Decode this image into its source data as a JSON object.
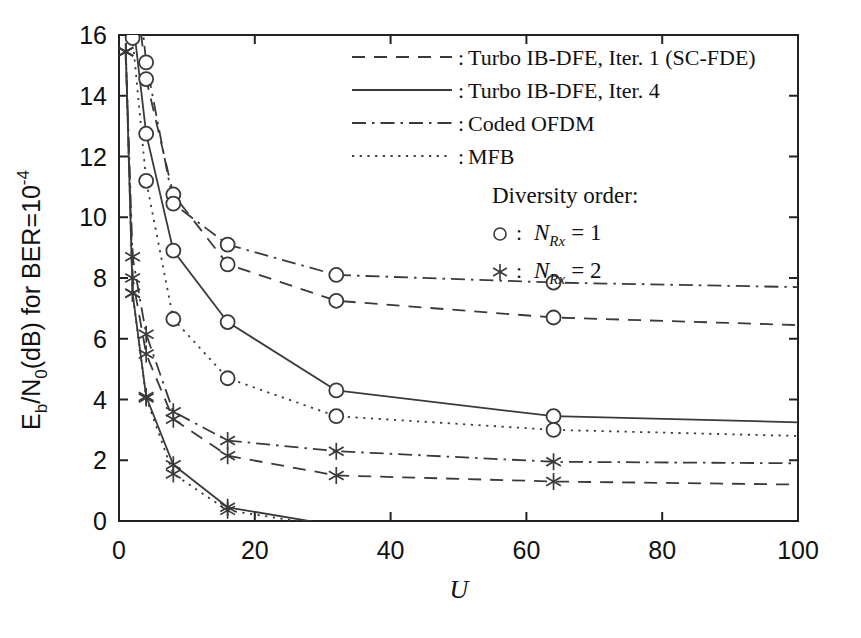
{
  "chart_data": {
    "type": "line",
    "title": "",
    "xlabel": "U",
    "ylabel": "E_b/N_0(dB) for BER=10^-4",
    "ylabel_parts": {
      "main1": "E",
      "sub1": "b",
      "main2": "/N",
      "sub2": "0",
      "main3": "(dB) for BER=10",
      "sup": "-4"
    },
    "xlim": [
      0,
      100
    ],
    "ylim": [
      0,
      16
    ],
    "xticks": [
      0,
      20,
      40,
      60,
      80,
      100
    ],
    "yticks": [
      0,
      2,
      4,
      6,
      8,
      10,
      12,
      14,
      16
    ],
    "grid": false,
    "legend_position": "top-right",
    "x": [
      1,
      2,
      4,
      8,
      16,
      32,
      64,
      100
    ],
    "series": [
      {
        "name": "Turbo IB-DFE, Iter. 1 (SC-FDE), NRx=1",
        "style": "dashed",
        "marker": "circle",
        "diversity": 1,
        "values": [
          24.0,
          18.6,
          14.55,
          10.75,
          8.45,
          7.25,
          6.7,
          6.45
        ]
      },
      {
        "name": "Turbo IB-DFE, Iter. 4, NRx=1",
        "style": "solid",
        "marker": "circle",
        "diversity": 1,
        "values": [
          21.0,
          16.6,
          12.75,
          8.9,
          6.55,
          4.3,
          3.45,
          3.25
        ]
      },
      {
        "name": "Coded OFDM, NRx=1",
        "style": "dashdot",
        "marker": "circle",
        "diversity": 1,
        "values": [
          25.0,
          19.4,
          15.1,
          10.45,
          9.1,
          8.1,
          7.85,
          7.7
        ]
      },
      {
        "name": "MFB, NRx=1",
        "style": "dotted",
        "marker": "circle",
        "diversity": 1,
        "values": [
          20.0,
          15.9,
          11.2,
          6.65,
          4.7,
          3.45,
          3.0,
          2.8
        ]
      },
      {
        "name": "Turbo IB-DFE, Iter. 1 (SC-FDE), NRx=2",
        "style": "dashed",
        "marker": "star",
        "diversity": 2,
        "values": [
          15.45,
          8.0,
          5.5,
          3.35,
          2.15,
          1.5,
          1.3,
          1.2
        ]
      },
      {
        "name": "Turbo IB-DFE, Iter. 4, NRx=2",
        "style": "solid",
        "marker": "star",
        "diversity": 2,
        "values": [
          15.45,
          7.5,
          4.1,
          1.85,
          0.45,
          -0.15,
          -0.45,
          -0.5
        ]
      },
      {
        "name": "Coded OFDM, NRx=2",
        "style": "dashdot",
        "marker": "star",
        "diversity": 2,
        "values": [
          15.45,
          8.7,
          6.15,
          3.6,
          2.65,
          2.3,
          1.95,
          1.9
        ]
      },
      {
        "name": "MFB, NRx=2",
        "style": "dotted",
        "marker": "star",
        "diversity": 2,
        "values": [
          15.45,
          7.5,
          4.05,
          1.55,
          0.35,
          -0.2,
          -0.5,
          -0.55
        ]
      }
    ]
  },
  "axes": {
    "x_tick_labels": [
      "0",
      "20",
      "40",
      "60",
      "80",
      "100"
    ],
    "y_tick_labels": [
      "0",
      "2",
      "4",
      "6",
      "8",
      "10",
      "12",
      "14",
      "16"
    ],
    "x_axis_title": "U"
  },
  "legend": {
    "entries": [
      {
        "sep": ":",
        "label": "Turbo IB-DFE, Iter. 1 (SC-FDE)",
        "style": "dashed"
      },
      {
        "sep": ":",
        "label": "Turbo IB-DFE, Iter. 4",
        "style": "solid"
      },
      {
        "sep": ":",
        "label": "Coded OFDM",
        "style": "dashdot"
      },
      {
        "sep": ":",
        "label": "MFB",
        "style": "dotted"
      }
    ],
    "diversity_header": "Diversity order:",
    "diversity_entries": [
      {
        "marker": "circle",
        "sep": ":",
        "sym": "N",
        "sub": "Rx",
        "eq": "= 1"
      },
      {
        "marker": "star",
        "sep": ":",
        "sym": "N",
        "sub": "Rx",
        "eq": "= 2"
      }
    ]
  },
  "colors": {
    "line": "#3a3a3a",
    "axis": "#222222",
    "text": "#111111",
    "background": "#ffffff"
  }
}
